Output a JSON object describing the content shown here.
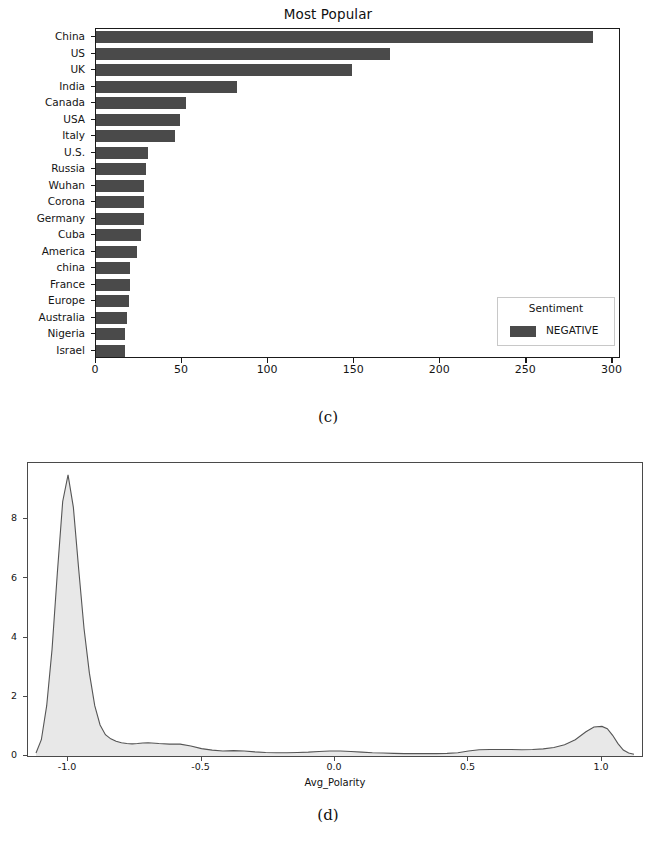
{
  "figure_c": {
    "caption": "(c)",
    "title": "Most Popular",
    "legend": {
      "title": "Sentiment",
      "entries": [
        "NEGATIVE"
      ]
    },
    "bar_color": "#4a4a4a"
  },
  "figure_d": {
    "caption": "(d)",
    "xaxis_title": "Avg_Polarity",
    "fill_color": "#e8e8e8",
    "line_color": "#555555"
  },
  "chart_data": [
    {
      "type": "bar",
      "orientation": "horizontal",
      "title": "Most Popular",
      "xlabel": "",
      "ylabel": "",
      "categories": [
        "China",
        "US",
        "UK",
        "India",
        "Canada",
        "USA",
        "Italy",
        "U.S.",
        "Russia",
        "Wuhan",
        "Corona",
        "Germany",
        "Cuba",
        "America",
        "china",
        "France",
        "Europe",
        "Australia",
        "Nigeria",
        "Israel"
      ],
      "values": [
        289,
        171,
        149,
        82,
        52,
        49,
        46,
        30,
        29,
        28,
        28,
        28,
        26,
        24,
        20,
        20,
        19,
        18,
        17,
        17
      ],
      "xlim": [
        0,
        305
      ],
      "xticks": [
        0,
        50,
        100,
        150,
        200,
        250,
        300
      ],
      "xticklabels": [
        "0",
        "50",
        "100",
        "150",
        "200",
        "250",
        "300"
      ],
      "grid": false,
      "legend": {
        "title": "Sentiment",
        "position": "lower right",
        "entries": [
          {
            "name": "NEGATIVE",
            "color": "#4a4a4a"
          }
        ]
      },
      "series": [
        {
          "name": "NEGATIVE",
          "color": "#4a4a4a",
          "values": [
            289,
            171,
            149,
            82,
            52,
            49,
            46,
            30,
            29,
            28,
            28,
            28,
            26,
            24,
            20,
            20,
            19,
            18,
            17,
            17
          ]
        }
      ]
    },
    {
      "type": "area",
      "subtype": "kde-density",
      "title": "",
      "xlabel": "Avg_Polarity",
      "ylabel": "",
      "xlim": [
        -1.15,
        1.15
      ],
      "ylim": [
        0,
        9.9
      ],
      "xticks": [
        -1.0,
        -0.5,
        0.0,
        0.5,
        1.0
      ],
      "xticklabels": [
        "-1.0",
        "-0.5",
        "0.0",
        "0.5",
        "1.0"
      ],
      "yticks": [
        0,
        2,
        4,
        6,
        8
      ],
      "yticklabels": [
        "0",
        "2",
        "4",
        "6",
        "8"
      ],
      "grid": false,
      "fill_color": "#e8e8e8",
      "line_color": "#555555",
      "x": [
        -1.12,
        -1.1,
        -1.08,
        -1.06,
        -1.04,
        -1.02,
        -1.0,
        -0.98,
        -0.96,
        -0.94,
        -0.92,
        -0.9,
        -0.88,
        -0.86,
        -0.84,
        -0.82,
        -0.8,
        -0.78,
        -0.76,
        -0.74,
        -0.72,
        -0.7,
        -0.66,
        -0.62,
        -0.58,
        -0.54,
        -0.5,
        -0.46,
        -0.42,
        -0.38,
        -0.34,
        -0.3,
        -0.26,
        -0.22,
        -0.18,
        -0.14,
        -0.1,
        -0.06,
        -0.02,
        0.02,
        0.06,
        0.1,
        0.14,
        0.18,
        0.22,
        0.26,
        0.3,
        0.34,
        0.38,
        0.42,
        0.46,
        0.5,
        0.54,
        0.58,
        0.62,
        0.66,
        0.7,
        0.74,
        0.78,
        0.82,
        0.86,
        0.9,
        0.94,
        0.97,
        1.0,
        1.02,
        1.04,
        1.06,
        1.08,
        1.1,
        1.12
      ],
      "y": [
        0.1,
        0.55,
        1.7,
        3.6,
        6.2,
        8.6,
        9.5,
        8.4,
        6.3,
        4.3,
        2.8,
        1.7,
        1.05,
        0.72,
        0.58,
        0.5,
        0.45,
        0.42,
        0.41,
        0.42,
        0.44,
        0.45,
        0.42,
        0.4,
        0.4,
        0.34,
        0.25,
        0.2,
        0.17,
        0.18,
        0.17,
        0.14,
        0.12,
        0.11,
        0.11,
        0.12,
        0.13,
        0.15,
        0.17,
        0.17,
        0.15,
        0.13,
        0.11,
        0.1,
        0.09,
        0.08,
        0.08,
        0.08,
        0.08,
        0.09,
        0.11,
        0.17,
        0.21,
        0.22,
        0.22,
        0.22,
        0.21,
        0.22,
        0.24,
        0.29,
        0.38,
        0.55,
        0.82,
        0.98,
        1.0,
        0.92,
        0.7,
        0.42,
        0.2,
        0.1,
        0.06
      ]
    }
  ]
}
